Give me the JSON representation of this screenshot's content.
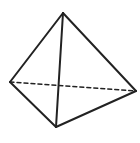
{
  "diagram": {
    "type": "tetrahedron",
    "canvas": {
      "width": 140,
      "height": 143,
      "background": "#ffffff"
    },
    "stroke_color": "#222222",
    "stroke_width": 2,
    "vertices": {
      "top": {
        "x": 63,
        "y": 13
      },
      "left": {
        "x": 10,
        "y": 82
      },
      "right": {
        "x": 136,
        "y": 91
      },
      "bottom": {
        "x": 56,
        "y": 127
      }
    },
    "edges": [
      {
        "from": "top",
        "to": "left",
        "style": "solid"
      },
      {
        "from": "top",
        "to": "right",
        "style": "solid"
      },
      {
        "from": "top",
        "to": "bottom",
        "style": "solid"
      },
      {
        "from": "left",
        "to": "bottom",
        "style": "solid"
      },
      {
        "from": "bottom",
        "to": "right",
        "style": "solid"
      },
      {
        "from": "left",
        "to": "right",
        "style": "dashed"
      }
    ],
    "dash_pattern": "4 3"
  }
}
